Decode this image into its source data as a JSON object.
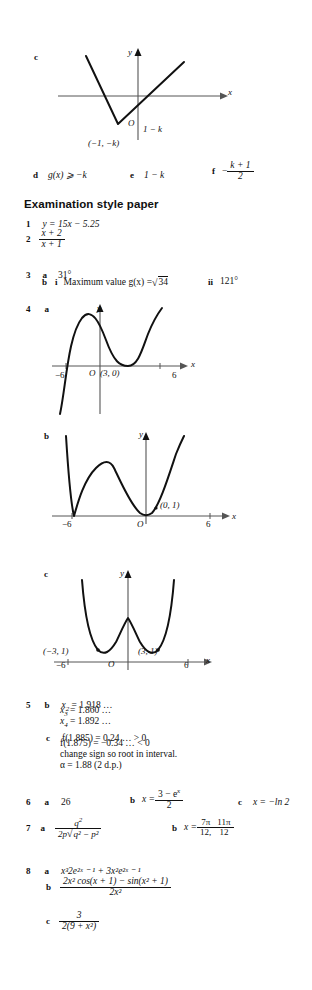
{
  "page": {
    "background": "#ffffff",
    "ink": "#101010"
  },
  "section_c_graph": {
    "part_label": "c",
    "axis_x_label": "x",
    "axis_y_label": "y",
    "origin_label": "O",
    "intercept_label": "1 − k",
    "vertex_label": "(−1, −k)",
    "shape": "v-shape-modulus"
  },
  "answers_def": {
    "d": {
      "label": "d",
      "text": "g(x) ⩾ −k"
    },
    "e": {
      "label": "e",
      "text": "1 − k"
    },
    "f": {
      "label": "f",
      "sign": "−",
      "num": "k + 1",
      "den": "2"
    }
  },
  "exam_heading": "Examination style paper",
  "q1": {
    "num": "1",
    "text": "y = 15x − 5.25"
  },
  "q2": {
    "num": "2",
    "frac_num": "x + 2",
    "frac_den": "x + 1"
  },
  "q3": {
    "num": "3",
    "a_label": "a",
    "a_text": "31°",
    "b_label": "b",
    "bi_label": "i",
    "bi_text": "Maximum value g(x) = ",
    "bi_radicand": "34",
    "bii_label": "ii",
    "bii_text": "121°"
  },
  "q4": {
    "num": "4",
    "a": {
      "label": "a",
      "axis_x": "x",
      "axis_y": "y",
      "origin": "O",
      "tick_left": "−6",
      "tick_right": "6",
      "point_label": "(3, 0)",
      "shape": "cubic with root at -6 and repeated root at 3"
    },
    "b": {
      "label": "b",
      "axis_x": "x",
      "axis_y": "y",
      "origin": "O",
      "tick_left": "−6",
      "tick_right": "6",
      "point_label": "(0, 1)",
      "shape": "modulus of cubic, touches axis at -6 and near 0"
    },
    "c": {
      "label": "c",
      "axis_x": "x",
      "axis_y": "y",
      "origin": "O",
      "tick_left": "−6",
      "tick_right": "6",
      "min_left_label": "(−3, 1)",
      "min_right_label": "(3, 1)",
      "shape": "W shaped curve with minima at (-3,1) and (3,1)"
    }
  },
  "q5": {
    "num": "5",
    "b_label": "b",
    "b_lines": [
      {
        "var": "x",
        "sub": "2",
        "val": "= 1.918 …"
      },
      {
        "var": "x",
        "sub": "3",
        "val": "= 1.860 …"
      },
      {
        "var": "x",
        "sub": "4",
        "val": "= 1.892 …"
      }
    ],
    "c_label": "c",
    "c_lines": [
      "f(1.885) = 0.24 … > 0",
      "f(1.875) = −0.34 … < 0",
      "change sign so root in interval.",
      "α = 1.88 (2 d.p.)"
    ]
  },
  "q6": {
    "num": "6",
    "a_label": "a",
    "a_text": "26",
    "b_label": "b",
    "b_lead": "x = ",
    "b_num": "3 − e",
    "b_num_sup": "x",
    "b_den": "2",
    "c_label": "c",
    "c_text": "x = −ln 2"
  },
  "q7": {
    "num": "7",
    "a_label": "a",
    "a_num": "q",
    "a_num_sup": "2",
    "a_den_pre": "2p",
    "a_den_rad": "q² − p²",
    "b_label": "b",
    "b_lead": "x = ",
    "b_frac1_num": "7π",
    "b_frac1_den": "12,",
    "b_frac2_num": "11π",
    "b_frac2_den": "12"
  },
  "q8": {
    "num": "8",
    "a_label": "a",
    "a_text": "x³2e²ˣ ⁻ ¹ + 3x²e²ˣ ⁻ ¹",
    "b_label": "b",
    "b_num": "2x² cos(x + 1) − sin(x² + 1)",
    "b_den": "2x²",
    "c_label": "c",
    "c_num": "3",
    "c_den": "2(9 + x²)"
  }
}
